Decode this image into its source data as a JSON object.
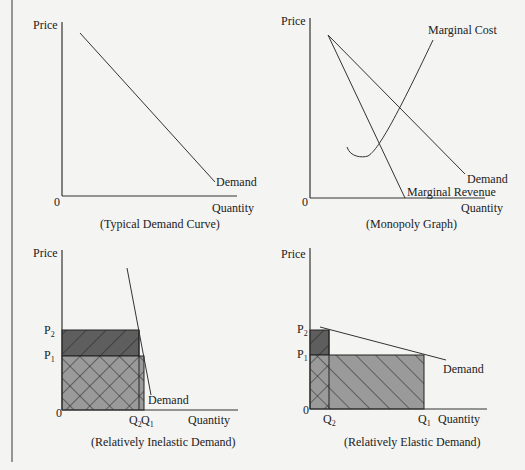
{
  "left_rule": {
    "x": 12,
    "y1": 0,
    "y2": 462
  },
  "panels": [
    {
      "id": "typical-demand",
      "caption": "(Typical Demand Curve)",
      "y_label": "Price",
      "x_label": "Quantity",
      "origin_label": "0",
      "curves": [
        {
          "name": "Demand",
          "label": "Demand"
        }
      ]
    },
    {
      "id": "monopoly",
      "caption": "(Monopoly Graph)",
      "y_label": "Price",
      "x_label": "Quantity",
      "origin_label": "0",
      "curves": [
        {
          "name": "Marginal Cost",
          "label": "Marginal Cost"
        },
        {
          "name": "Demand",
          "label": "Demand"
        },
        {
          "name": "Marginal Revenue",
          "label": "Marginal Revenue"
        }
      ]
    },
    {
      "id": "inelastic",
      "caption": "(Relatively Inelastic Demand)",
      "y_label": "Price",
      "x_label": "Quantity",
      "origin_label": "0",
      "curves": [
        {
          "name": "Demand",
          "label": "Demand"
        }
      ],
      "ticks": {
        "p2": "P",
        "p2_sub": "2",
        "p1": "P",
        "p1_sub": "1",
        "q2": "Q",
        "q2_sub": "2",
        "q1": "Q",
        "q1_sub": "1"
      }
    },
    {
      "id": "elastic",
      "caption": "(Relatively Elastic Demand)",
      "y_label": "Price",
      "x_label": "Quantity",
      "origin_label": "0",
      "curves": [
        {
          "name": "Demand",
          "label": "Demand"
        }
      ],
      "ticks": {
        "p2": "P",
        "p2_sub": "2",
        "p1": "P",
        "p1_sub": "1",
        "q2": "Q",
        "q2_sub": "2",
        "q1": "Q",
        "q1_sub": "1"
      }
    }
  ],
  "colors": {
    "background": "#f4f4f2",
    "line": "#333333",
    "dark_fill": "#5e5e5e",
    "light_fill": "#9a9a9a"
  }
}
